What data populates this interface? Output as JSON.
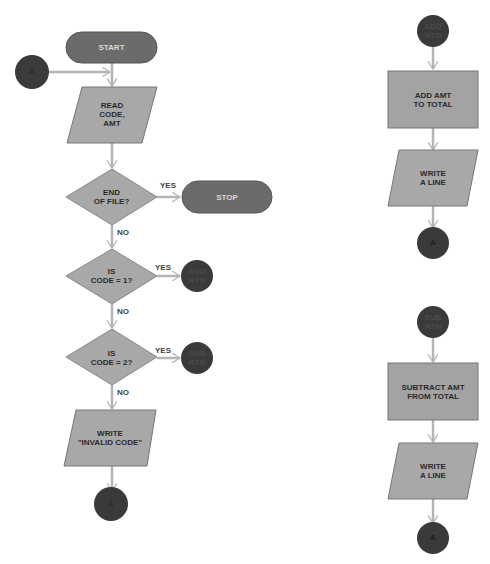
{
  "colors": {
    "terminal": "#6b6b6b",
    "connector": "#3a3a3a",
    "process": "#a3a3a3",
    "io": "#a8a8a8",
    "decision": "#a8a8a8",
    "arrow": "#b4b4b4",
    "background": "#ffffff"
  },
  "main_flow": {
    "start": "START",
    "entry_connector": "A",
    "read_input": "READ\nCODE,\nAMT",
    "decision_eof": "END\nOF FILE?",
    "eof_yes": "YES",
    "eof_no": "NO",
    "stop": "STOP",
    "decision_code1": "IS\nCODE = 1?",
    "code1_yes": "YES",
    "code1_no": "NO",
    "add_rtn_connector": "ADD\nRTN",
    "decision_code2": "IS\nCODE = 2?",
    "code2_yes": "YES",
    "code2_no": "NO",
    "sub_rtn_connector": "SUB\nRTN",
    "write_invalid": "WRITE\n\"INVALID CODE\"",
    "exit_connector": "A"
  },
  "add_routine": {
    "entry": "ADD\nRTN",
    "process": "ADD AMT\nTO TOTAL",
    "write": "WRITE\nA LINE",
    "exit": "A"
  },
  "sub_routine": {
    "entry": "SUB\nRTN",
    "process": "SUBTRACT AMT\nFROM TOTAL",
    "write": "WRITE\nA LINE",
    "exit": "A"
  }
}
